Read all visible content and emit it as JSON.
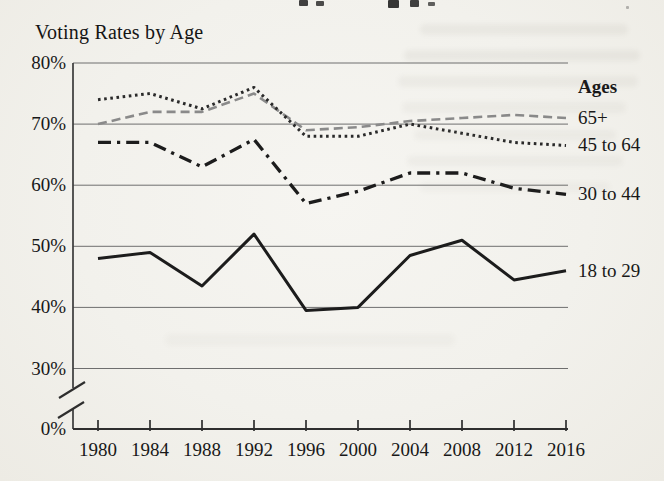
{
  "chart": {
    "title": "Voting Rates by Age",
    "legend_header": "Ages",
    "y_axis_labels": [
      "80%",
      "70%",
      "60%",
      "50%",
      "40%",
      "30%",
      "0%"
    ],
    "x_axis_labels": [
      "1980",
      "1984",
      "1988",
      "1992",
      "1996",
      "2000",
      "2004",
      "2008",
      "2012",
      "2016"
    ]
  },
  "chart_data": {
    "type": "line",
    "title": "Voting Rates by Age",
    "xlabel": "",
    "ylabel": "",
    "x": [
      1980,
      1984,
      1988,
      1992,
      1996,
      2000,
      2004,
      2008,
      2012,
      2016
    ],
    "series": [
      {
        "name": "65+",
        "values": [
          70,
          72,
          72,
          75,
          69,
          69.5,
          70.5,
          71,
          71.5,
          71
        ],
        "style": "dashed",
        "color": "#8a8a8a"
      },
      {
        "name": "45 to 64",
        "values": [
          74,
          75,
          72.5,
          76,
          68,
          68,
          70,
          68.5,
          67,
          66.5
        ],
        "style": "dotted",
        "color": "#2a2a2a"
      },
      {
        "name": "30 to 44",
        "values": [
          67,
          67,
          63,
          67.5,
          57,
          59,
          62,
          62,
          59.5,
          58.5
        ],
        "style": "dashdot",
        "color": "#1c1c1c"
      },
      {
        "name": "18 to 29",
        "values": [
          48,
          49,
          43.5,
          52,
          39.5,
          40,
          48.5,
          51,
          44.5,
          46
        ],
        "style": "solid",
        "color": "#1c1c1c"
      }
    ],
    "y_axis": {
      "ticks": [
        80,
        70,
        60,
        50,
        40,
        30,
        0
      ],
      "unit": "%",
      "plot_min": 30,
      "plot_max": 80,
      "axis_break_between": [
        0,
        30
      ]
    },
    "grid": true,
    "legend_position": "right",
    "legend_header": "Ages",
    "colors": {
      "ink": "#1c1c1c",
      "grid": "#6e6e6e",
      "gray_line": "#8a8a8a",
      "paper": "#f2f1ec"
    }
  }
}
